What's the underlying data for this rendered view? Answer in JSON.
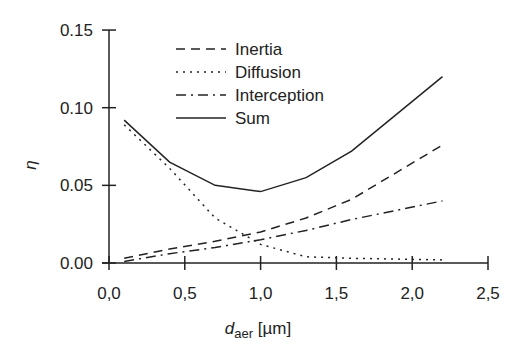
{
  "chart_data": {
    "type": "line",
    "title": "",
    "xlabel": "d_aer [µm]",
    "xlabel_main": "d",
    "xlabel_sub": "aer",
    "xlabel_unit": " [µm]",
    "ylabel": "η",
    "xlim": [
      0.0,
      2.5
    ],
    "ylim": [
      0.0,
      0.15
    ],
    "x_ticks": [
      "0,0",
      "0,5",
      "1,0",
      "1,5",
      "2,0",
      "2,5"
    ],
    "y_ticks": [
      "0.00",
      "0.05",
      "0.10",
      "0.15"
    ],
    "grid": false,
    "legend_position": "upper center",
    "x": [
      0.1,
      0.4,
      0.7,
      1.0,
      1.3,
      1.6,
      2.2
    ],
    "series": [
      {
        "name": "Inertia",
        "style": "dashed",
        "values": [
          0.003,
          0.009,
          0.014,
          0.02,
          0.029,
          0.041,
          0.076
        ]
      },
      {
        "name": "Diffusion",
        "style": "dotted",
        "values": [
          0.089,
          0.061,
          0.029,
          0.012,
          0.004,
          0.003,
          0.002
        ]
      },
      {
        "name": "Interception",
        "style": "dashdot",
        "values": [
          0.001,
          0.006,
          0.01,
          0.015,
          0.021,
          0.028,
          0.04
        ]
      },
      {
        "name": "Sum",
        "style": "solid",
        "values": [
          0.092,
          0.065,
          0.05,
          0.046,
          0.055,
          0.072,
          0.12
        ]
      }
    ]
  }
}
